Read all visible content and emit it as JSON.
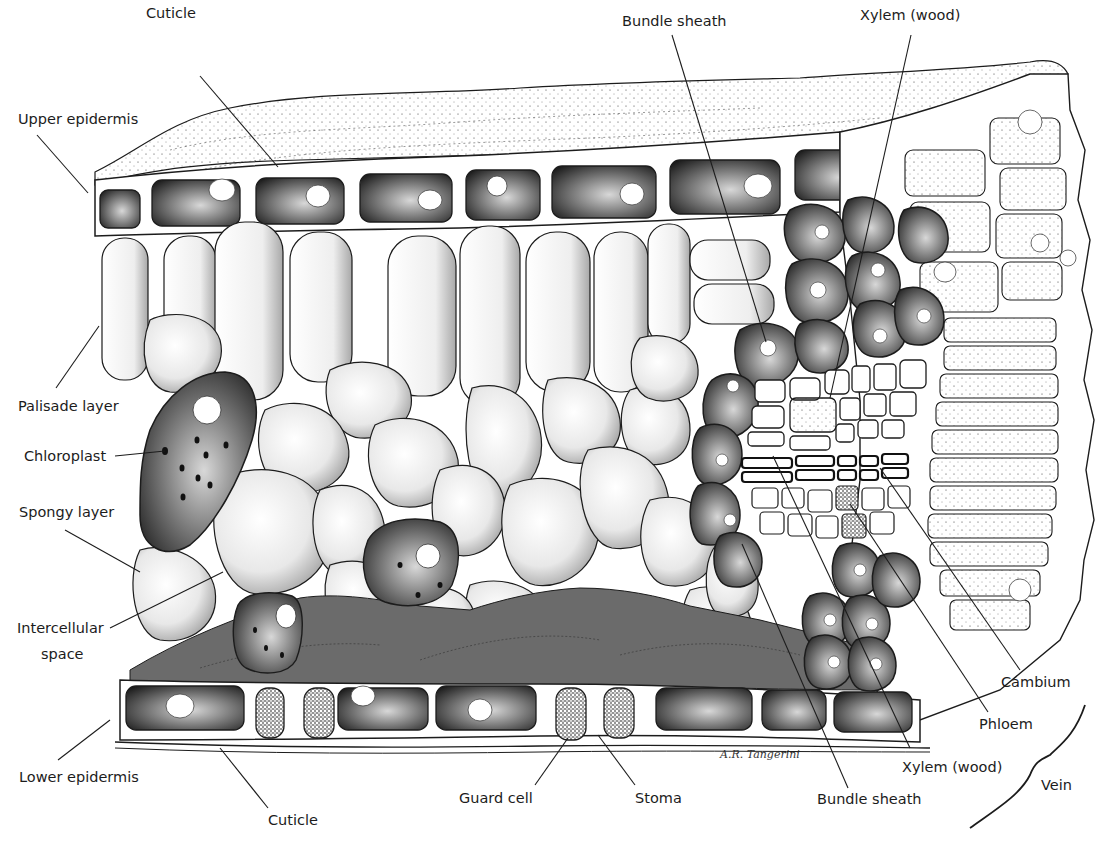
{
  "diagram": {
    "signature": "A.R. Tangerini",
    "colors": {
      "ink": "#1c1c1c",
      "intercellular_fill": "#6b6b6b",
      "cell_fill": "#ffffff",
      "stipple": "#2a2a2a"
    },
    "labels": [
      {
        "id": "cuticle_top",
        "text": "Cuticle",
        "x": 146,
        "y": 10
      },
      {
        "id": "upper_epidermis",
        "text": "Upper epidermis",
        "x": 18,
        "y": 110
      },
      {
        "id": "palisade_layer",
        "text": "Palisade layer",
        "x": 18,
        "y": 398
      },
      {
        "id": "chloroplast",
        "text": "Chloroplast",
        "x": 24,
        "y": 450
      },
      {
        "id": "spongy_layer",
        "text": "Spongy layer",
        "x": 19,
        "y": 506
      },
      {
        "id": "intercellular_space_1",
        "text": "Intercellular",
        "x": 17,
        "y": 624
      },
      {
        "id": "intercellular_space_2",
        "text": "space",
        "x": 41,
        "y": 650
      },
      {
        "id": "lower_epidermis",
        "text": "Lower epidermis",
        "x": 19,
        "y": 770
      },
      {
        "id": "cuticle_bottom",
        "text": "Cuticle",
        "x": 268,
        "y": 813
      },
      {
        "id": "guard_cell",
        "text": "Guard cell",
        "x": 459,
        "y": 790
      },
      {
        "id": "stoma",
        "text": "Stoma",
        "x": 635,
        "y": 790
      },
      {
        "id": "bundle_sheath_top",
        "text": "Bundle sheath",
        "x": 622,
        "y": 14
      },
      {
        "id": "xylem_top",
        "text": "Xylem (wood)",
        "x": 860,
        "y": 10
      },
      {
        "id": "cambium",
        "text": "Cambium",
        "x": 1001,
        "y": 676
      },
      {
        "id": "phloem",
        "text": "Phloem",
        "x": 979,
        "y": 719
      },
      {
        "id": "xylem_bottom",
        "text": "Xylem (wood)",
        "x": 902,
        "y": 762
      },
      {
        "id": "bundle_sheath_bottom",
        "text": "Bundle sheath",
        "x": 817,
        "y": 793
      },
      {
        "id": "vein",
        "text": "Vein",
        "x": 1041,
        "y": 778
      }
    ]
  }
}
